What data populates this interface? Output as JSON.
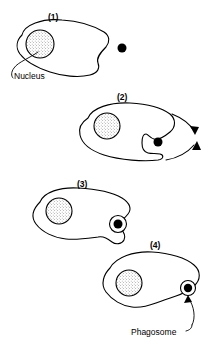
{
  "figure": {
    "width": 213,
    "height": 348,
    "background_color": "#ffffff",
    "line_color": "#000000"
  },
  "panels": [
    {
      "id": "panel-1",
      "label": "(1)",
      "label_x": 48,
      "label_y": 12,
      "description": "Phagocyte with nucleus approaches a particle"
    },
    {
      "id": "panel-2",
      "label": "(2)",
      "label_x": 117,
      "label_y": 92,
      "description": "Pseudopods extend around the particle"
    },
    {
      "id": "panel-3",
      "label": "(3)",
      "label_x": 77,
      "label_y": 179,
      "description": "Pseudopods fuse, enclosing the particle"
    },
    {
      "id": "panel-4",
      "label": "(4)",
      "label_x": 150,
      "label_y": 240,
      "description": "Particle is internalised within a phagosome"
    }
  ],
  "annotations": [
    {
      "id": "nucleus-label",
      "text": "Nucleus",
      "x": 14,
      "y": 71
    },
    {
      "id": "phagosome-label",
      "text": "Phagosome",
      "x": 131,
      "y": 327
    }
  ]
}
